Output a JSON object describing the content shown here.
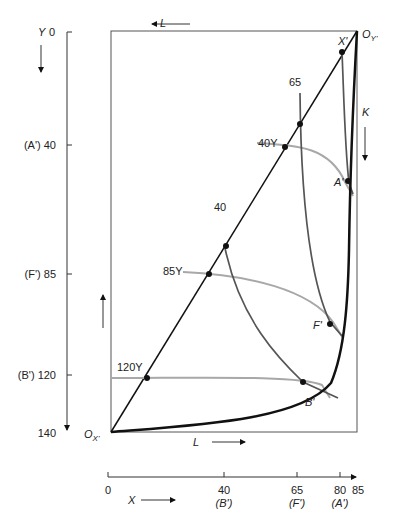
{
  "axes": {
    "y_axis": {
      "label": "Y",
      "ticks": [
        {
          "value": "0",
          "prefix": ""
        },
        {
          "value": "40",
          "prefix": "(A')"
        },
        {
          "value": "85",
          "prefix": "(F')"
        },
        {
          "value": "120",
          "prefix": "(B')"
        },
        {
          "value": "140",
          "prefix": ""
        }
      ]
    },
    "x_axis": {
      "label": "X",
      "ticks": [
        {
          "value": "0",
          "sub": ""
        },
        {
          "value": "40",
          "sub": "(B')"
        },
        {
          "value": "65",
          "sub": "(F')"
        },
        {
          "value": "80",
          "sub": "(A')"
        },
        {
          "value": "85",
          "sub": ""
        }
      ]
    }
  },
  "box": {
    "top_label": "L",
    "bottom_label": "L",
    "right_label": "K",
    "origin_x": "O",
    "origin_x_sub": "X",
    "origin_y": "O",
    "origin_y_sub": "Y"
  },
  "isoquants": {
    "x": [
      "X'",
      "65X",
      "40X"
    ],
    "y": [
      "40Y",
      "85Y",
      "120Y"
    ]
  },
  "points": [
    "A'",
    "F'",
    "B'"
  ],
  "labels": {
    "x_prime": "X'",
    "x65": "65",
    "x40": "40",
    "y40": "40Y",
    "y85": "85Y",
    "y120": "120Y",
    "a_prime": "A'",
    "f_prime": "F'",
    "b_prime": "B'",
    "y_title": "Y",
    "y0": "0",
    "y40_tick": "(A') 40",
    "y85_tick": "(F') 85",
    "y120_tick": "(B') 120",
    "y140_tick": "140",
    "x_title": "X",
    "x0": "0",
    "x80": "80",
    "x85": "85",
    "x40_sub": "(B')",
    "x65_sub": "(F')",
    "x80_sub": "(A')",
    "L_top": "L",
    "L_bottom": "L",
    "K": "K",
    "OX": "O",
    "OX_sub": "X'",
    "OY": "O",
    "OY_sub": "Y'"
  },
  "colors": {
    "ink": "#111111",
    "gray_isoquant": "#a8a8a8",
    "dark_isoquant": "#555555"
  }
}
